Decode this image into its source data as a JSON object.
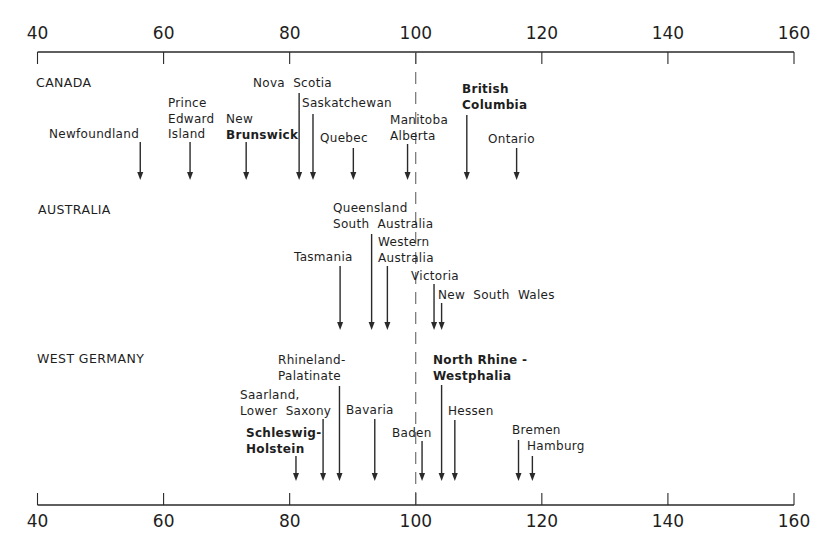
{
  "chart_data": {
    "type": "dot-arrow",
    "title": "",
    "xlabel": "",
    "ylabel": "",
    "xlim": [
      40,
      160
    ],
    "xticks": [
      40,
      60,
      80,
      100,
      120,
      140,
      160
    ],
    "xtick_labels": [
      "40",
      "60",
      "80",
      "100",
      "120",
      "140",
      "160"
    ],
    "reference_line": {
      "x": 100,
      "style": "dashed"
    },
    "axes": [
      "top",
      "bottom"
    ],
    "grid": false,
    "groups": [
      {
        "name": "CANADA",
        "items": [
          {
            "label": "Newfoundland",
            "value": 56
          },
          {
            "label": "Prince Edward Island",
            "value": 64
          },
          {
            "label": "New Brunswick",
            "value": 73
          },
          {
            "label": "Nova Scotia",
            "value": 81.5
          },
          {
            "label": "Saskatchewan",
            "value": 84
          },
          {
            "label": "Quebec",
            "value": 90
          },
          {
            "label": "Manitoba",
            "value": 99
          },
          {
            "label": "Alberta",
            "value": 99
          },
          {
            "label": "British Columbia",
            "value": 108
          },
          {
            "label": "Ontario",
            "value": 116
          }
        ]
      },
      {
        "name": "AUSTRALIA",
        "items": [
          {
            "label": "Tasmania",
            "value": 88
          },
          {
            "label": "Queensland",
            "value": 93
          },
          {
            "label": "South Australia",
            "value": 93
          },
          {
            "label": "Western Australia",
            "value": 95.5
          },
          {
            "label": "Victoria",
            "value": 103
          },
          {
            "label": "New South Wales",
            "value": 104
          }
        ]
      },
      {
        "name": "WEST GERMANY",
        "items": [
          {
            "label": "Schleswig-Holstein",
            "value": 81
          },
          {
            "label": "Saarland",
            "value": 85.5
          },
          {
            "label": "Lower Saxony",
            "value": 85.5
          },
          {
            "label": "Rhineland-Palatinate",
            "value": 88
          },
          {
            "label": "Bavaria",
            "value": 93.5
          },
          {
            "label": "Baden",
            "value": 101
          },
          {
            "label": "North Rhine-Westphalia",
            "value": 104
          },
          {
            "label": "Hessen",
            "value": 106
          },
          {
            "label": "Bremen",
            "value": 116.5
          },
          {
            "label": "Hamburg",
            "value": 118.5
          }
        ]
      }
    ]
  },
  "axis": {
    "ticks": [
      {
        "value": 40,
        "label": "40"
      },
      {
        "value": 60,
        "label": "60"
      },
      {
        "value": 80,
        "label": "80"
      },
      {
        "value": 100,
        "label": "100"
      },
      {
        "value": 120,
        "label": "120"
      },
      {
        "value": 140,
        "label": "140"
      },
      {
        "value": 160,
        "label": "160"
      }
    ]
  },
  "groups": {
    "canada": {
      "title": "CANADA"
    },
    "australia": {
      "title": "AUSTRALIA"
    },
    "germany": {
      "title": "WEST GERMANY"
    }
  },
  "arrows": [
    {
      "id": "newfoundland",
      "value": 56.3,
      "y1": 142,
      "y2": 180,
      "text_lines": [
        "Newfoundland"
      ],
      "tx": 49,
      "ty": 127,
      "bold": false
    },
    {
      "id": "prince-edward-island",
      "value": 64.2,
      "y1": 142,
      "y2": 180,
      "text_lines": [
        "Prince",
        "Edward",
        "Island"
      ],
      "tx": 168,
      "ty": 96,
      "bold": false
    },
    {
      "id": "new-brunswick",
      "value": 73.1,
      "y1": 142,
      "y2": 180,
      "text_lines": [
        "New",
        "Brunswick"
      ],
      "tx": 226,
      "ty": 112,
      "bold": false,
      "bold_lines": [
        1
      ]
    },
    {
      "id": "nova-scotia",
      "value": 81.5,
      "y1": 93,
      "y2": 180,
      "text_lines": [
        "Nova  Scotia"
      ],
      "tx": 253,
      "ty": 76,
      "bold": false
    },
    {
      "id": "saskatchewan",
      "value": 83.7,
      "y1": 114,
      "y2": 180,
      "text_lines": [
        "Saskatchewan"
      ],
      "tx": 302,
      "ty": 96,
      "bold": false
    },
    {
      "id": "quebec",
      "value": 90.1,
      "y1": 148,
      "y2": 180,
      "text_lines": [
        "Quebec"
      ],
      "tx": 320,
      "ty": 131,
      "bold": false
    },
    {
      "id": "manitoba-alberta",
      "value": 98.7,
      "y1": 144,
      "y2": 180,
      "text_lines": [
        "Manitoba",
        "Alberta"
      ],
      "tx": 390,
      "ty": 113,
      "bold": false
    },
    {
      "id": "british-columbia",
      "value": 108.1,
      "y1": 115,
      "y2": 180,
      "text_lines": [
        "British",
        "Columbia"
      ],
      "tx": 462,
      "ty": 82,
      "bold": true
    },
    {
      "id": "ontario",
      "value": 116.0,
      "y1": 148,
      "y2": 180,
      "text_lines": [
        "Ontario"
      ],
      "tx": 488,
      "ty": 132,
      "bold": false
    },
    {
      "id": "tasmania",
      "value": 88.0,
      "y1": 266,
      "y2": 330,
      "text_lines": [
        "Tasmania"
      ],
      "tx": 294,
      "ty": 250,
      "bold": false
    },
    {
      "id": "queensland-south-australia",
      "value": 93.0,
      "y1": 234,
      "y2": 330,
      "text_lines": [
        "Queensland",
        "South  Australia"
      ],
      "tx": 333,
      "ty": 201,
      "bold": false
    },
    {
      "id": "western-australia",
      "value": 95.5,
      "y1": 266,
      "y2": 330,
      "text_lines": [
        "Western",
        "Australia"
      ],
      "tx": 378,
      "ty": 235,
      "bold": false
    },
    {
      "id": "victoria",
      "value": 102.9,
      "y1": 284,
      "y2": 330,
      "text_lines": [
        "Victoria"
      ],
      "tx": 411,
      "ty": 269,
      "bold": false
    },
    {
      "id": "new-south-wales",
      "value": 104.1,
      "y1": 303,
      "y2": 330,
      "text_lines": [
        "New  South  Wales"
      ],
      "tx": 438,
      "ty": 288,
      "bold": false
    },
    {
      "id": "schleswig-holstein",
      "value": 81.0,
      "y1": 456,
      "y2": 481,
      "text_lines": [
        "Schleswig-",
        "Holstein"
      ],
      "tx": 246,
      "ty": 426,
      "bold": true
    },
    {
      "id": "saarland-lower-saxony",
      "value": 85.3,
      "y1": 419,
      "y2": 481,
      "text_lines": [
        "Saarland,",
        "Lower  Saxony"
      ],
      "tx": 240,
      "ty": 388,
      "bold": false
    },
    {
      "id": "rhineland-palatinate",
      "value": 87.9,
      "y1": 386,
      "y2": 481,
      "text_lines": [
        "Rhineland-",
        "Palatinate"
      ],
      "tx": 278,
      "ty": 353,
      "bold": false
    },
    {
      "id": "bavaria",
      "value": 93.5,
      "y1": 419,
      "y2": 481,
      "text_lines": [
        "Bavaria"
      ],
      "tx": 346,
      "ty": 403,
      "bold": false
    },
    {
      "id": "baden",
      "value": 101.0,
      "y1": 441,
      "y2": 481,
      "text_lines": [
        "Baden"
      ],
      "tx": 392,
      "ty": 426,
      "bold": false
    },
    {
      "id": "north-rhine-westphalia",
      "value": 104.1,
      "y1": 385,
      "y2": 481,
      "text_lines": [
        "North Rhine -",
        "Westphalia"
      ],
      "tx": 433,
      "ty": 353,
      "bold": true
    },
    {
      "id": "hessen",
      "value": 106.2,
      "y1": 420,
      "y2": 481,
      "text_lines": [
        "Hessen"
      ],
      "tx": 448,
      "ty": 404,
      "bold": false
    },
    {
      "id": "bremen",
      "value": 116.3,
      "y1": 440,
      "y2": 481,
      "text_lines": [
        "Bremen"
      ],
      "tx": 512,
      "ty": 423,
      "bold": false
    },
    {
      "id": "hamburg",
      "value": 118.5,
      "y1": 456,
      "y2": 481,
      "text_lines": [
        "Hamburg"
      ],
      "tx": 527,
      "ty": 439,
      "bold": false
    }
  ],
  "layout": {
    "x0_value": 40,
    "x0_px": 37.5,
    "x1_value": 160,
    "x1_px": 794,
    "top_axis_y": 52,
    "bottom_axis_y": 505,
    "tick_len": 12,
    "ink": "#2a2a2a"
  }
}
